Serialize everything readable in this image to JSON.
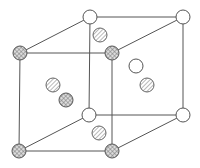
{
  "diagram": {
    "type": "crystal-unit-cell",
    "legend": [],
    "atom_kinds": {
      "white": "open circle",
      "hatch": "diagonally hatched circle",
      "cross": "cross-hatched circle"
    },
    "colors": {
      "line": "#555555",
      "background": "#ffffff",
      "hatch": "#888888"
    },
    "corners": [
      {
        "id": "back-top-left",
        "kind": "white"
      },
      {
        "id": "back-top-right",
        "kind": "white"
      },
      {
        "id": "back-bottom-left",
        "kind": "white"
      },
      {
        "id": "back-bottom-right",
        "kind": "white"
      },
      {
        "id": "front-top-left",
        "kind": "cross"
      },
      {
        "id": "front-top-right",
        "kind": "cross"
      },
      {
        "id": "front-bottom-left",
        "kind": "cross"
      },
      {
        "id": "front-bottom-right",
        "kind": "cross"
      }
    ],
    "interior_atoms": [
      {
        "id": "top-face",
        "kind": "hatch"
      },
      {
        "id": "bottom-face",
        "kind": "hatch"
      },
      {
        "id": "left-face-upper",
        "kind": "hatch"
      },
      {
        "id": "left-face-lower",
        "kind": "cross"
      },
      {
        "id": "right-face-upper",
        "kind": "white"
      },
      {
        "id": "right-face-lower",
        "kind": "hatch"
      }
    ]
  }
}
